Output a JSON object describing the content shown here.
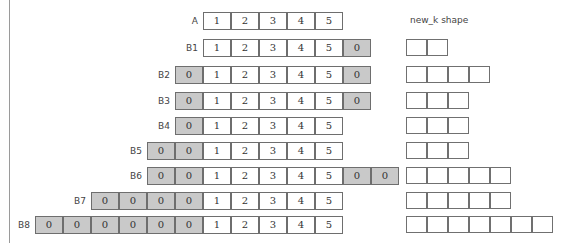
{
  "header": {
    "shape_label": "new_k  shape"
  },
  "rows": [
    {
      "label": "A",
      "left_pad": 0,
      "right_pad": 0,
      "values": [
        "1",
        "2",
        "3",
        "4",
        "5"
      ],
      "shape_boxes": 0
    },
    {
      "label": "B1",
      "left_pad": 0,
      "right_pad": 1,
      "values": [
        "1",
        "2",
        "3",
        "4",
        "5"
      ],
      "shape_boxes": 2
    },
    {
      "label": "B2",
      "left_pad": 1,
      "right_pad": 1,
      "values": [
        "1",
        "2",
        "3",
        "4",
        "5"
      ],
      "shape_boxes": 4
    },
    {
      "label": "B3",
      "left_pad": 1,
      "right_pad": 1,
      "values": [
        "1",
        "2",
        "3",
        "4",
        "5"
      ],
      "shape_boxes": 3
    },
    {
      "label": "B4",
      "left_pad": 1,
      "right_pad": 0,
      "values": [
        "1",
        "2",
        "3",
        "4",
        "5"
      ],
      "shape_boxes": 3
    },
    {
      "label": "B5",
      "left_pad": 2,
      "right_pad": 0,
      "values": [
        "1",
        "2",
        "3",
        "4",
        "5"
      ],
      "shape_boxes": 3
    },
    {
      "label": "B6",
      "left_pad": 2,
      "right_pad": 2,
      "values": [
        "1",
        "2",
        "3",
        "4",
        "5"
      ],
      "shape_boxes": 5
    },
    {
      "label": "B7",
      "left_pad": 4,
      "right_pad": 0,
      "values": [
        "1",
        "2",
        "3",
        "4",
        "5"
      ],
      "shape_boxes": 5
    },
    {
      "label": "B8",
      "left_pad": 6,
      "right_pad": 0,
      "values": [
        "1",
        "2",
        "3",
        "4",
        "5"
      ],
      "shape_boxes": 7
    }
  ],
  "pad_value": "0",
  "colors": {
    "pad_fill": "#c9c9c9",
    "border": "#6e6e6e"
  }
}
